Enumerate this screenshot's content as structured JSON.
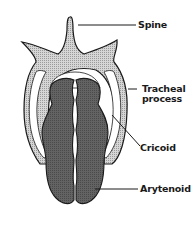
{
  "figure": {
    "type": "anatomical-diagram",
    "labels": [
      {
        "id": "spine",
        "text": "Spine"
      },
      {
        "id": "tracheal_process",
        "line1": "Tracheal",
        "line2": "process"
      },
      {
        "id": "cricoid",
        "text": "Cricoid"
      },
      {
        "id": "arytenoid",
        "text": "Arytenoid"
      }
    ],
    "colors": {
      "background": "#ffffff",
      "outline": "#1a1a1a",
      "cricoid_fill": "#c8c8c8",
      "arytenoid_fill": "#5e5e5e",
      "inner_gap": "#ffffff"
    }
  }
}
